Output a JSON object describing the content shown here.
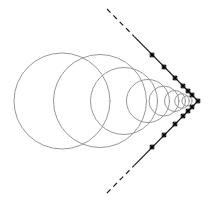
{
  "figure": {
    "width": 218,
    "height": 197,
    "background_color": "#ffffff"
  },
  "style": {
    "circle_stroke_color": "#8c8c8c",
    "circle_stroke_width": 0.9,
    "tangent_stroke_color": "#1a1a1a",
    "tangent_stroke_width": 1.2,
    "tangent_dash_pattern": "5,4",
    "mark_stroke_color": "#000000",
    "mark_stroke_width": 1.3,
    "mark_size": 4.2
  },
  "chart_data": {
    "type": "diagram",
    "apex": {
      "x": 198,
      "y": 101
    },
    "axis_of_symmetry_y": 101,
    "half_angle_degrees": 42,
    "circles": [
      {
        "index": 1,
        "cx": 62,
        "cy": 101,
        "r": 48.0
      },
      {
        "index": 2,
        "cx": 100,
        "cy": 101,
        "r": 46.5
      },
      {
        "index": 3,
        "cx": 124,
        "cy": 101,
        "r": 33.5
      },
      {
        "index": 4,
        "cx": 148,
        "cy": 101,
        "r": 21.5
      },
      {
        "index": 5,
        "cx": 164,
        "cy": 101,
        "r": 15.0
      },
      {
        "index": 6,
        "cx": 175,
        "cy": 101,
        "r": 10.5
      },
      {
        "index": 7,
        "cx": 182,
        "cy": 101,
        "r": 7.3
      },
      {
        "index": 8,
        "cx": 187,
        "cy": 101,
        "r": 5.1
      }
    ],
    "tangent_lines": [
      {
        "name": "upper-side",
        "from": {
          "x": 107,
          "y": 9
        },
        "to": {
          "x": 198,
          "y": 101
        },
        "solid_from_fraction": 0.3
      },
      {
        "name": "lower-side",
        "from": {
          "x": 107,
          "y": 193
        },
        "to": {
          "x": 198,
          "y": 101
        },
        "solid_from_fraction": 0.3
      }
    ],
    "tangency_marks": [
      {
        "circle": 1,
        "side": "upper",
        "x": 152,
        "y": 55
      },
      {
        "circle": 2,
        "side": "upper",
        "x": 164,
        "y": 67
      },
      {
        "circle": 3,
        "side": "upper",
        "x": 175,
        "y": 78
      },
      {
        "circle": 4,
        "side": "upper",
        "x": 183,
        "y": 86
      },
      {
        "circle": 5,
        "side": "upper",
        "x": 188,
        "y": 91
      },
      {
        "circle": 6,
        "side": "upper",
        "x": 192,
        "y": 95
      },
      {
        "circle": 7,
        "side": "apex",
        "x": 198,
        "y": 101
      },
      {
        "circle": 1,
        "side": "lower",
        "x": 152,
        "y": 147
      },
      {
        "circle": 2,
        "side": "lower",
        "x": 164,
        "y": 135
      },
      {
        "circle": 3,
        "side": "lower",
        "x": 175,
        "y": 124
      },
      {
        "circle": 4,
        "side": "lower",
        "x": 183,
        "y": 116
      },
      {
        "circle": 5,
        "side": "lower",
        "x": 188,
        "y": 111
      },
      {
        "circle": 6,
        "side": "lower",
        "x": 192,
        "y": 107
      }
    ],
    "xlabel": "",
    "ylabel": "",
    "legend": [],
    "grid": false,
    "annotations": []
  }
}
